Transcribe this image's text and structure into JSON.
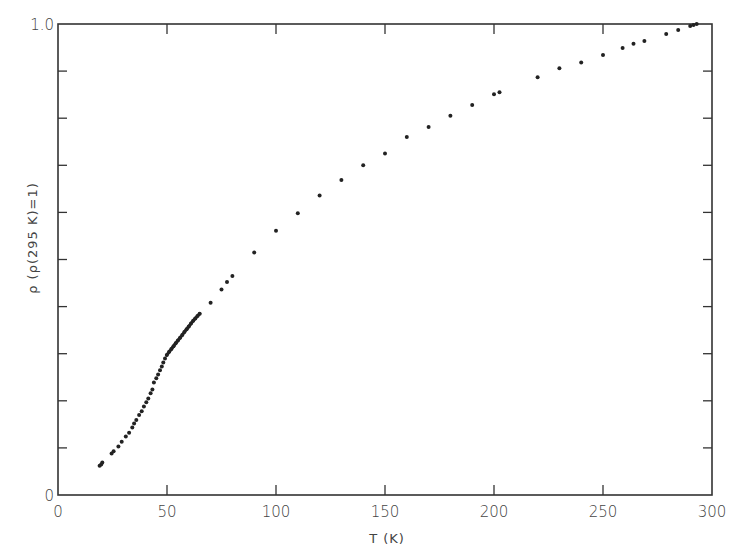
{
  "chart_data": {
    "type": "scatter",
    "title": "",
    "xlabel": "T (K)",
    "ylabel": "ρ (ρ(295 K)=1)",
    "xlim": [
      0,
      300
    ],
    "ylim": [
      0,
      1.0
    ],
    "x_ticks": [
      0,
      50,
      100,
      150,
      200,
      250,
      300
    ],
    "x_tick_labels": [
      "0",
      "50",
      "100",
      "150",
      "200",
      "250",
      "300"
    ],
    "y_ticks": [
      0,
      0.1,
      0.2,
      0.3,
      0.4,
      0.5,
      0.6,
      0.7,
      0.8,
      0.9,
      1.0
    ],
    "y_tick_labels": [
      "0",
      "",
      "",
      "",
      "",
      "",
      "",
      "",
      "",
      "",
      "1.0"
    ],
    "grid": false,
    "legend": null,
    "series": [
      {
        "name": "resistivity",
        "marker": "dot",
        "color": "#222222",
        "x": [
          19.1,
          19.8,
          20.3,
          24.6,
          25.5,
          27.7,
          29.2,
          31.1,
          32.6,
          34.1,
          34.9,
          35.9,
          37.2,
          38.4,
          39.4,
          40.5,
          41.4,
          42.5,
          43.3,
          44.0,
          45.1,
          45.9,
          46.8,
          47.6,
          48.3,
          49.1,
          49.9,
          51.0,
          52.0,
          53.0,
          54.0,
          55.0,
          56.0,
          57.0,
          58.0,
          59.0,
          60.0,
          61.0,
          62.0,
          63.0,
          64.0,
          65.0,
          70,
          75,
          77.5,
          80,
          90,
          100,
          110,
          120,
          130,
          140,
          150,
          160,
          170,
          180,
          190,
          200,
          202.5,
          220,
          230,
          240,
          250,
          259,
          264,
          269,
          279,
          284.5,
          290,
          291.5,
          293
        ],
        "y": [
          0.062,
          0.065,
          0.069,
          0.088,
          0.093,
          0.103,
          0.113,
          0.124,
          0.132,
          0.143,
          0.152,
          0.159,
          0.17,
          0.178,
          0.188,
          0.197,
          0.205,
          0.216,
          0.224,
          0.239,
          0.248,
          0.256,
          0.265,
          0.273,
          0.281,
          0.29,
          0.297,
          0.304,
          0.31,
          0.316,
          0.322,
          0.328,
          0.334,
          0.34,
          0.346,
          0.352,
          0.358,
          0.364,
          0.37,
          0.375,
          0.38,
          0.385,
          0.408,
          0.436,
          0.452,
          0.465,
          0.515,
          0.561,
          0.598,
          0.636,
          0.669,
          0.7,
          0.725,
          0.76,
          0.781,
          0.805,
          0.828,
          0.851,
          0.855,
          0.887,
          0.906,
          0.918,
          0.934,
          0.949,
          0.958,
          0.964,
          0.979,
          0.987,
          0.996,
          0.998,
          1.0
        ]
      }
    ],
    "annotations": []
  },
  "plot_frame": {
    "left_px": 58,
    "right_px": 712,
    "top_px": 24,
    "bottom_px": 495
  }
}
